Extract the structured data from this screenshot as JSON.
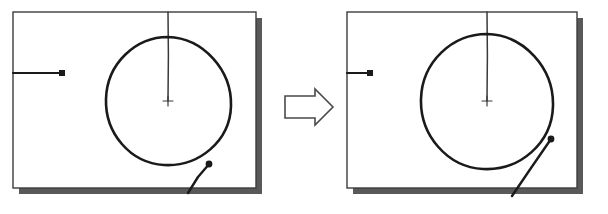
{
  "figure": {
    "background_color": "#ffffff",
    "width": 608,
    "height": 214,
    "ink_color": "#1a1a1a",
    "shadow_color": "#595959",
    "panel_border_color": "#3c3c3c",
    "panel_fill_color": "#ffffff"
  },
  "transition": {
    "name": "right-arrow",
    "icon": "arrow-right-outline-icon",
    "label": "",
    "direction": "right",
    "fill": "#ffffff",
    "stroke": "#4a4a4a"
  },
  "panels": [
    {
      "id": "before",
      "name": "sketch-panel-before",
      "caption": "",
      "frame": {
        "x": 13,
        "y": 12,
        "width": 243,
        "height": 176
      },
      "shadow_offset": {
        "dx": 6,
        "dy": 6
      },
      "circle": {
        "cx": 168,
        "cy": 101,
        "rx": 62,
        "ry": 64
      },
      "center_marker": {
        "x": 168,
        "y": 101,
        "size": 9,
        "icon": "crosshair-icon"
      },
      "radius_line": {
        "x1": 168,
        "y1": 12,
        "x2": 168,
        "y2": 101
      },
      "leader_line": {
        "x1": 13,
        "y1": 73,
        "x2": 62,
        "y2": 73
      },
      "leader_dot": {
        "x": 62,
        "y": 73,
        "size": 5
      },
      "tangent_point": {
        "x": 207,
        "y": 166,
        "size": 4,
        "location": "bottom-right-of-circle"
      },
      "tangent_line": {
        "x1": 207,
        "y1": 166,
        "x2": 188,
        "y2": 193
      }
    },
    {
      "id": "after",
      "name": "sketch-panel-after",
      "caption": "",
      "frame": {
        "x": 347,
        "y": 12,
        "width": 230,
        "height": 176
      },
      "shadow_offset": {
        "dx": 6,
        "dy": 6
      },
      "circle": {
        "cx": 487,
        "cy": 101,
        "rx": 66,
        "ry": 67
      },
      "center_marker": {
        "x": 487,
        "y": 101,
        "size": 9,
        "icon": "crosshair-icon"
      },
      "radius_line": {
        "x1": 487,
        "y1": 12,
        "x2": 487,
        "y2": 101
      },
      "leader_line": {
        "x1": 347,
        "y1": 73,
        "x2": 370,
        "y2": 73
      },
      "leader_dot": {
        "x": 370,
        "y": 73,
        "size": 5
      },
      "tangent_point": {
        "x": 551,
        "y": 140,
        "size": 4,
        "location": "right-of-circle"
      },
      "tangent_line": {
        "x1": 551,
        "y1": 140,
        "x2": 512,
        "y2": 196
      }
    }
  ]
}
